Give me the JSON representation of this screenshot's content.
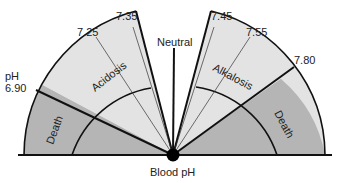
{
  "diagram": {
    "title": "Blood pH",
    "neutral_label": "Neutral",
    "ph_label": "pH",
    "ticks": [
      {
        "label": "6.90",
        "side": "left"
      },
      {
        "label": "7.25",
        "side": "left"
      },
      {
        "label": "7.35",
        "side": "left"
      },
      {
        "label": "7.45",
        "side": "right"
      },
      {
        "label": "7.55",
        "side": "right"
      },
      {
        "label": "7.80",
        "side": "right"
      }
    ],
    "regions": {
      "acidosis": "Acidosis",
      "alkalosis": "Alkalosis",
      "death_left": "Death",
      "death_right": "Death"
    },
    "colors": {
      "light_fill": "#e3e3e3",
      "dark_fill": "#b5b5b5",
      "line": "#111111"
    }
  }
}
